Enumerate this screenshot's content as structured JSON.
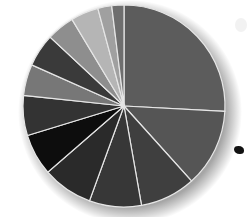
{
  "chart_data": {
    "type": "pie",
    "title": "",
    "legend": "none",
    "labels_visible": false,
    "center": [
      124,
      106
    ],
    "radius": 101,
    "start_angle_deg": 0,
    "direction": "clockwise",
    "slices": [
      {
        "index": 1,
        "degrees": 93,
        "percent": 25.8,
        "color": "#5c5c5c"
      },
      {
        "index": 2,
        "degrees": 45,
        "percent": 12.5,
        "color": "#555555"
      },
      {
        "index": 3,
        "degrees": 32,
        "percent": 8.9,
        "color": "#3f3f3f"
      },
      {
        "index": 4,
        "degrees": 30,
        "percent": 8.3,
        "color": "#373737"
      },
      {
        "index": 5,
        "degrees": 29,
        "percent": 8.1,
        "color": "#2a2a2a"
      },
      {
        "index": 6,
        "degrees": 24,
        "percent": 6.7,
        "color": "#0d0d0d"
      },
      {
        "index": 7,
        "degrees": 23,
        "percent": 6.4,
        "color": "#333333"
      },
      {
        "index": 8,
        "degrees": 18,
        "percent": 5.0,
        "color": "#777777"
      },
      {
        "index": 9,
        "degrees": 19,
        "percent": 5.3,
        "color": "#3a3a3a"
      },
      {
        "index": 10,
        "degrees": 16,
        "percent": 4.4,
        "color": "#8e8e8e"
      },
      {
        "index": 11,
        "degrees": 16,
        "percent": 4.4,
        "color": "#b5b5b5"
      },
      {
        "index": 12,
        "degrees": 8,
        "percent": 2.2,
        "color": "#a0a0a0"
      },
      {
        "index": 13,
        "degrees": 7,
        "percent": 1.9,
        "color": "#6e6e6e"
      }
    ],
    "slice_border_color": "#e6e6e6"
  }
}
